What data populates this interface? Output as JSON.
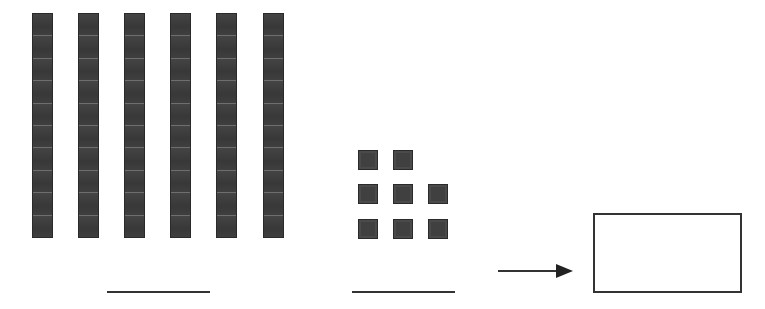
{
  "worksheet": {
    "tens": {
      "count": 6,
      "segments_per_rod": 10,
      "rods": [
        {
          "x": 32
        },
        {
          "x": 78
        },
        {
          "x": 124
        },
        {
          "x": 170
        },
        {
          "x": 216
        },
        {
          "x": 263
        }
      ]
    },
    "ones": {
      "count": 8,
      "cubes": [
        {
          "x": 358,
          "y": 150
        },
        {
          "x": 393,
          "y": 150
        },
        {
          "x": 358,
          "y": 184
        },
        {
          "x": 393,
          "y": 184
        },
        {
          "x": 428,
          "y": 184
        },
        {
          "x": 358,
          "y": 219
        },
        {
          "x": 393,
          "y": 219
        },
        {
          "x": 428,
          "y": 219
        }
      ]
    },
    "tens_answer_line": {
      "value": ""
    },
    "ones_answer_line": {
      "value": ""
    },
    "arrow": {
      "icon": "arrow-right-icon"
    },
    "answer_box": {
      "value": ""
    },
    "colors": {
      "block": "#3c3c3c",
      "block_divider": "#6e6e6e",
      "line": "#333333"
    }
  }
}
